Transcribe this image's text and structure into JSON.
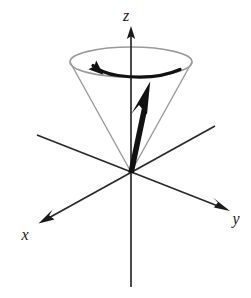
{
  "figure": {
    "background_color": "#ffffff"
  },
  "axes": {
    "z": {
      "label": "z",
      "color": "#1a1a1a",
      "line": {
        "x1": 131,
        "y1": 287,
        "x2": 131,
        "y2": 29
      },
      "arrow_tip": {
        "x": 131,
        "y": 27
      },
      "label_pos": {
        "x": 126,
        "y": 20
      },
      "has_arrowhead": true
    },
    "x": {
      "label": "x",
      "color": "#1a1a1a",
      "line": {
        "x1": 215,
        "y1": 126,
        "x2": 42,
        "y2": 221
      },
      "arrow_tip": {
        "x": 39,
        "y": 223
      },
      "label_pos": {
        "x": 25,
        "y": 239
      },
      "has_arrowhead": true
    },
    "y": {
      "label": "y",
      "color": "#1a1a1a",
      "line": {
        "x1": 37,
        "y1": 135,
        "x2": 226,
        "y2": 209
      },
      "arrow_tip": {
        "x": 229,
        "y": 211
      },
      "label_pos": {
        "x": 234,
        "y": 224
      },
      "has_arrowhead": true
    },
    "origin": {
      "x": 131,
      "y": 172
    }
  },
  "cone": {
    "name": "precession-cone",
    "stroke_color": "#9a9a9a",
    "rim_ellipse": {
      "cx": 131,
      "cy": 62,
      "rx": 61,
      "ry": 15
    },
    "apex": {
      "x": 131,
      "y": 172
    },
    "left_edge": {
      "x1": 70,
      "y1": 62,
      "x2": 131,
      "y2": 172
    },
    "right_edge": {
      "x1": 192,
      "y1": 62,
      "x2": 131,
      "y2": 172
    }
  },
  "vector": {
    "name": "angular-momentum-vector",
    "color": "#111111",
    "tail": {
      "x": 131,
      "y": 172
    },
    "tip": {
      "x": 150,
      "y": 82
    },
    "shaft_width": 5,
    "head_length": 34,
    "head_width": 20
  },
  "precession_arrow": {
    "name": "precession-direction-arrow",
    "color": "#111111",
    "stroke_width": 3,
    "direction": "counterclockwise-viewed-from-above",
    "start": {
      "x": 180,
      "y": 70
    },
    "end": {
      "x": 92,
      "y": 61
    },
    "arrow_tip": {
      "x": 86,
      "y": 60
    }
  },
  "colors": {
    "ink": "#1a1a1a",
    "bold_ink": "#111111",
    "cone_gray": "#9a9a9a",
    "background": "#ffffff"
  }
}
